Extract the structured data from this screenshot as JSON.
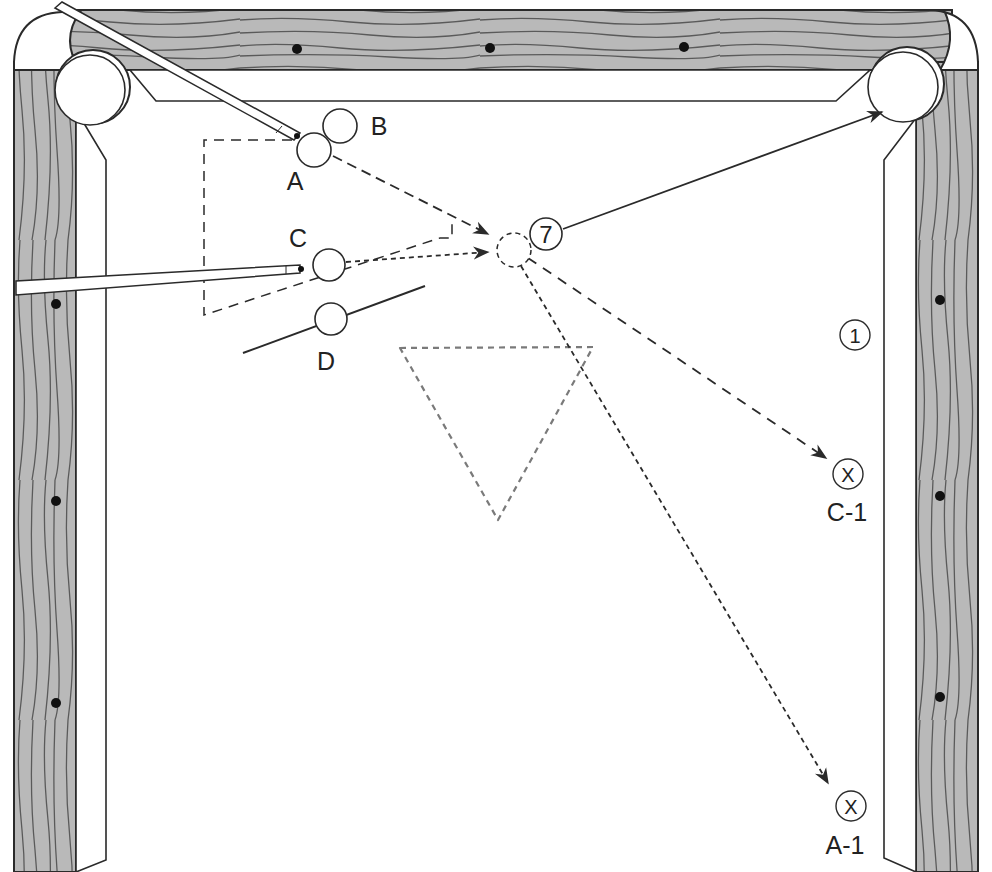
{
  "diagram": {
    "colors": {
      "rail_wood": "#b9b9b9",
      "wood_grain": "#5a5a5a",
      "line": "#2a2a2a",
      "rack_outline": "#7a7a7a",
      "felt": "#ffffff"
    },
    "balls": [
      {
        "id": "A",
        "label": "A",
        "x": 314,
        "y": 150
      },
      {
        "id": "B",
        "label": "B",
        "x": 340,
        "y": 126
      },
      {
        "id": "C",
        "label": "C",
        "x": 329,
        "y": 265
      },
      {
        "id": "D",
        "label": "D",
        "x": 331,
        "y": 319
      },
      {
        "id": "7",
        "label": "7",
        "x": 546,
        "y": 234
      },
      {
        "id": "1",
        "label": "1",
        "x": 855,
        "y": 335
      }
    ],
    "ghost_ball": {
      "x": 514,
      "y": 250
    },
    "targets": [
      {
        "id": "C-1",
        "symbol": "X",
        "label": "C-1",
        "x": 848,
        "y": 474
      },
      {
        "id": "A-1",
        "symbol": "X",
        "label": "A-1",
        "x": 851,
        "y": 806
      }
    ],
    "labels": {
      "A": "A",
      "B": "B",
      "C": "C",
      "D": "D",
      "seven": "7",
      "one": "1",
      "x1": "X",
      "x2": "X",
      "c1": "C-1",
      "a1": "A-1"
    },
    "paths": [
      {
        "from": "A",
        "to": "ghost_ball",
        "style": "dashed-arrow"
      },
      {
        "from": "C",
        "to": "ghost_ball",
        "style": "dotted-arrow"
      },
      {
        "from": "7",
        "to": "top-right-pocket",
        "style": "solid-arrow"
      },
      {
        "from": "ghost_ball",
        "to": "C-1",
        "style": "dashed-arrow"
      },
      {
        "from": "ghost_ball",
        "to": "A-1",
        "style": "dotted-arrow"
      }
    ],
    "pockets": [
      "top-left-corner",
      "top-right-corner"
    ],
    "cues": [
      "cue-aimed-at-A",
      "cue-aimed-at-C"
    ],
    "rack_outline": "triangle (dotted, gray)"
  }
}
